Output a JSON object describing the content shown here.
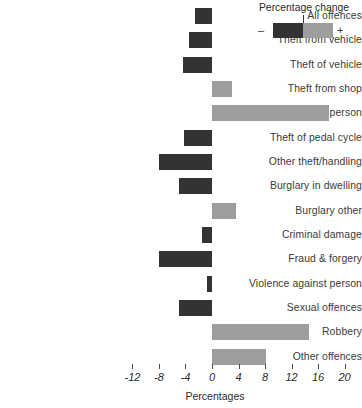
{
  "chart_data": {
    "type": "bar",
    "orientation": "horizontal",
    "title": "",
    "xlabel": "Percentages",
    "ylabel": "",
    "xlim": [
      -14,
      21
    ],
    "xticks": [
      -12,
      -8,
      -4,
      0,
      4,
      8,
      12,
      16,
      20
    ],
    "xtick_labels": [
      "-12",
      "-8",
      "-4",
      "0",
      "4",
      "8",
      "12",
      "16",
      "20"
    ],
    "grid": false,
    "zero_line": 0,
    "categories": [
      "All offences",
      "Theft from vehicle",
      "Theft of vehicle",
      "Theft from shop",
      "Theft from person",
      "Theft of pedal cycle",
      "Other theft/handling",
      "Burglary in dwelling",
      "Burglary other",
      "Criminal damage",
      "Fraud & forgery",
      "Violence against person",
      "Sexual offences",
      "Robbery",
      "Other offences"
    ],
    "values": [
      -2.6,
      -3.4,
      -4.3,
      3.0,
      17.7,
      -4.2,
      -8.0,
      -5.0,
      3.6,
      -1.5,
      -8.0,
      -0.8,
      -5.0,
      14.6,
      8.2
    ],
    "colors": {
      "negative": "#333333",
      "positive": "#9e9e9e"
    },
    "legend": {
      "title": "Percentage change",
      "negative_symbol": "–",
      "positive_symbol": "+",
      "position": "top-right"
    }
  },
  "legend": {
    "title": "Percentage change",
    "minus": "–",
    "plus": "+"
  },
  "axis": {
    "title": "Percentages"
  }
}
